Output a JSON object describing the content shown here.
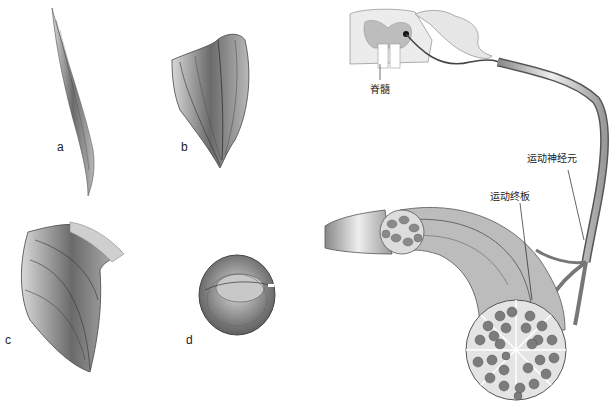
{
  "figure": {
    "muscle_labels": [
      "a",
      "b",
      "c",
      "d"
    ],
    "neuron_labels": {
      "spinal_cord": "脊髓",
      "motor_neuron": "运动神经元",
      "motor_end_plate": "运动终板"
    }
  }
}
